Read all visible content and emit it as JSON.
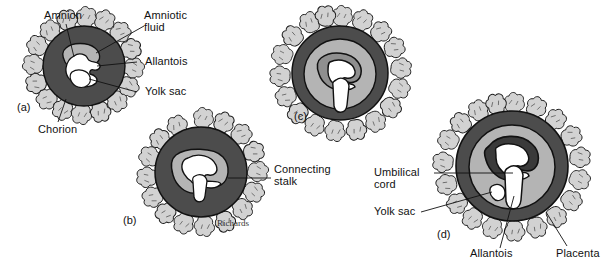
{
  "figure": {
    "signature": "Richards",
    "colors": {
      "chorion_wall": "#4c4c4c",
      "inner_cavity": "#b4b4b4",
      "embryo": "#ffffff",
      "outline": "#111111",
      "villi_fill": "#d2d2d2",
      "background": "#ffffff"
    }
  },
  "panels": [
    {
      "id": "(a)",
      "name": "stage-a"
    },
    {
      "id": "(b)",
      "name": "stage-b"
    },
    {
      "id": "(c)",
      "name": "stage-c"
    },
    {
      "id": "(d)",
      "name": "stage-d"
    }
  ],
  "labels": {
    "amnion": "Amnion",
    "amniotic_fluid_l1": "Amniotic",
    "amniotic_fluid_l2": "fluid",
    "allantois_a": "Allantois",
    "yolk_sac_a": "Yolk sac",
    "chorion": "Chorion",
    "connecting_stalk_l1": "Connecting",
    "connecting_stalk_l2": "stalk",
    "umbilical_cord_l1": "Umbilical",
    "umbilical_cord_l2": "cord",
    "yolk_sac_d": "Yolk sac",
    "allantois_d": "Allantois",
    "placenta": "Placenta"
  }
}
